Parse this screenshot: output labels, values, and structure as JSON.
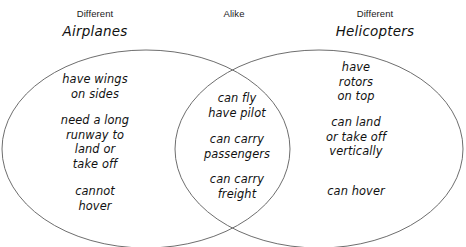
{
  "diagram": {
    "type": "venn-diagram",
    "title_left_small": "Different",
    "title_left_big": "Airplanes",
    "title_center": "Alike",
    "title_right_small": "Different",
    "title_right_big": "Helicopters",
    "stroke_color": "#6e6e6e",
    "text_color": "#111111",
    "background_color": "#ffffff"
  },
  "left_circle": {
    "label": "Airplanes",
    "groups": [
      {
        "lines": [
          "have wings",
          "on sides"
        ]
      },
      {
        "lines": [
          "need a long",
          "runway to",
          "land or",
          "take off"
        ]
      },
      {
        "lines": [
          "cannot",
          "hover"
        ]
      }
    ]
  },
  "center_overlap": {
    "label": "Alike",
    "groups": [
      {
        "lines": [
          "can fly",
          "have pilot"
        ]
      },
      {
        "lines": [
          "can carry",
          "passengers"
        ]
      },
      {
        "lines": [
          "can carry",
          "freight"
        ]
      }
    ]
  },
  "right_circle": {
    "label": "Helicopters",
    "groups": [
      {
        "lines": [
          "have",
          "rotors",
          "on top"
        ]
      },
      {
        "lines": [
          "can land",
          "or take off",
          "vertically"
        ]
      },
      {
        "lines": [
          "can hover"
        ]
      }
    ]
  }
}
